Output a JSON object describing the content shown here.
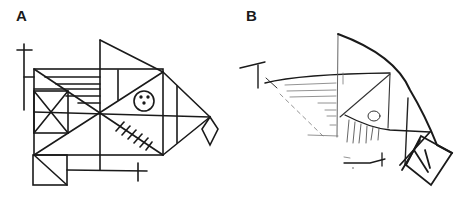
{
  "figure": {
    "panels": [
      {
        "label": "A",
        "content": "Rey-Osterrieth complex figure (original model)"
      },
      {
        "label": "B",
        "content": "Hand-drawn copy of the complex figure"
      }
    ],
    "colors": {
      "ink": "#1a1a1a",
      "faint_ink": "#6a6a6a",
      "background": "#ffffff"
    }
  }
}
